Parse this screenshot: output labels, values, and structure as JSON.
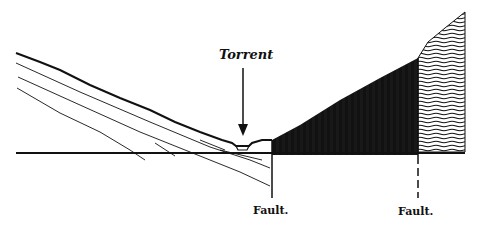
{
  "labels": {
    "torrent": "Torrent",
    "fault_left": "Fault.",
    "fault_right": "Fault."
  },
  "colors": {
    "ink": "#111111",
    "background": "#ffffff"
  }
}
